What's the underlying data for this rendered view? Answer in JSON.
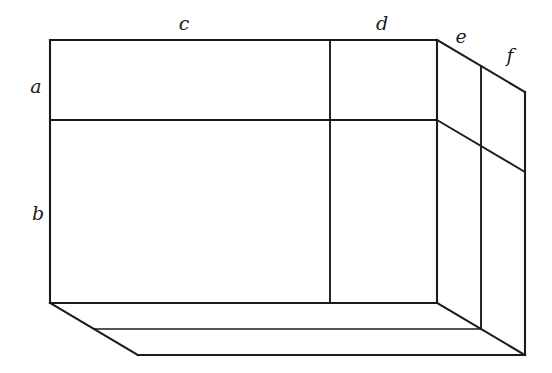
{
  "figure": {
    "background_color": "#ffffff",
    "line_color": "#1b1b1b",
    "label_color": "#1a1a1a",
    "width": 552,
    "height": 373,
    "projection": "oblique (cavalier), depth axis toward lower-left",
    "depth_vector": {
      "dx": -35,
      "dy": 21
    }
  },
  "labels": {
    "a": {
      "text": "a",
      "x": 36,
      "y": 93,
      "describes": "height of upper horizontal band on the front face"
    },
    "b": {
      "text": "b",
      "x": 38,
      "y": 220,
      "describes": "height of lower horizontal band on the front face"
    },
    "c": {
      "text": "c",
      "x": 184,
      "y": 30,
      "describes": "width of the left (wide) vertical panel"
    },
    "d": {
      "text": "d",
      "x": 382,
      "y": 30,
      "describes": "width of the second vertical panel"
    },
    "e": {
      "text": "e",
      "x": 461,
      "y": 43,
      "describes": "depth of the first receding panel"
    },
    "f": {
      "text": "f",
      "x": 510,
      "y": 62,
      "describes": "depth of the second receding panel"
    }
  },
  "geometry": {
    "front_face": {
      "top_left": [
        50,
        40
      ],
      "top_right": [
        437,
        40
      ],
      "bottom_right": [
        437,
        303
      ],
      "bottom_left": [
        50,
        303
      ],
      "horizontal_divider_y": 120,
      "vertical_divider_x": 330
    },
    "side_face": {
      "near_top": [
        437,
        40
      ],
      "far_top": [
        525,
        92
      ],
      "far_bottom": [
        525,
        355
      ],
      "near_bottom": [
        437,
        303
      ],
      "divider_near_top": [
        481,
        66
      ],
      "divider_near_bottom": [
        481,
        329
      ],
      "horizontal_slant_left": [
        437,
        120
      ],
      "horizontal_slant_right": [
        525,
        172
      ]
    },
    "bottom_face": {
      "front_left": [
        50,
        303
      ],
      "front_right": [
        437,
        303
      ],
      "back_left": [
        138,
        355
      ],
      "back_right": [
        525,
        355
      ],
      "mid_left": [
        94,
        329
      ],
      "mid_right": [
        481,
        329
      ]
    }
  },
  "edges": [
    {
      "name": "front-top-edge",
      "points": "50,40 437,40"
    },
    {
      "name": "front-left-edge",
      "points": "50,40 50,303"
    },
    {
      "name": "front-bottom-edge",
      "points": "50,303 437,303"
    },
    {
      "name": "front-right-edge",
      "points": "437,40 437,303"
    },
    {
      "name": "front-horizontal-divider",
      "points": "50,120 437,120"
    },
    {
      "name": "front-vertical-divider",
      "points": "330,40 330,303"
    },
    {
      "name": "side-top-receding-edge",
      "points": "437,40 525,92"
    },
    {
      "name": "side-far-vertical-edge",
      "points": "525,92 525,355"
    },
    {
      "name": "side-horizontal-slant",
      "points": "437,120 525,172"
    },
    {
      "name": "side-vertical-divider",
      "points": "481,66 481,329"
    },
    {
      "name": "bottom-left-receding-edge",
      "points": "50,303 138,355"
    },
    {
      "name": "bottom-mid-receding-edge",
      "points": "94,329 481,329"
    },
    {
      "name": "bottom-back-edge",
      "points": "138,355 525,355"
    },
    {
      "name": "bottom-right-receding-edge",
      "points": "437,303 525,355"
    }
  ]
}
